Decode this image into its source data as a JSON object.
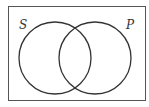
{
  "diagram": {
    "type": "venn",
    "sets": [
      {
        "label": "S",
        "cx": 55,
        "cy": 58,
        "r": 36
      },
      {
        "label": "P",
        "cx": 95,
        "cy": 58,
        "r": 36
      }
    ],
    "universe": {
      "x": 8,
      "y": 6,
      "width": 138,
      "height": 95
    },
    "stroke_color": "#333333"
  }
}
